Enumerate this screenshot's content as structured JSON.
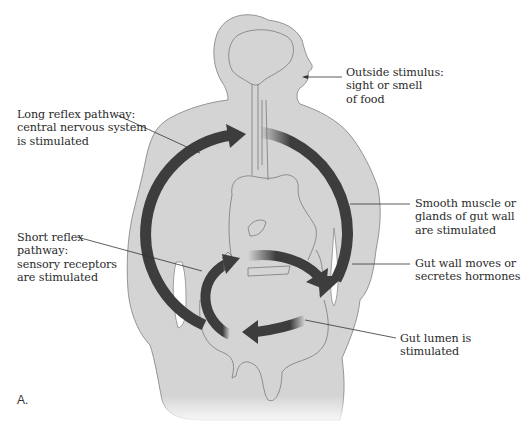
{
  "figure": {
    "panel_label": "A.",
    "colors": {
      "body_fill": "#d4d4d4",
      "body_outline": "#8a8a8a",
      "organ_outline": "#7a7a7a",
      "arrow": "#3d3d3d",
      "leader_line": "#333333",
      "text": "#2a2a2a",
      "background": "#ffffff"
    }
  },
  "labels": {
    "outside_stimulus": "Outside stimulus:\nsight or smell\nof food",
    "long_reflex": "Long reflex pathway:\ncentral nervous system\nis stimulated",
    "smooth_muscle": "Smooth muscle or\nglands of gut wall\nare stimulated",
    "short_reflex": "Short reflex\npathway:\nsensory receptors\nare stimulated",
    "gut_wall_moves": "Gut wall moves or\nsecretes hormones",
    "gut_lumen": "Gut lumen is\nstimulated"
  },
  "pathways": [
    {
      "name": "long-reflex-loop",
      "description": "Large circular pathway from gut up to CNS and back down to gut wall"
    },
    {
      "name": "short-reflex-loop",
      "description": "Small circular pathway within gut: lumen to receptors to gut wall"
    }
  ]
}
